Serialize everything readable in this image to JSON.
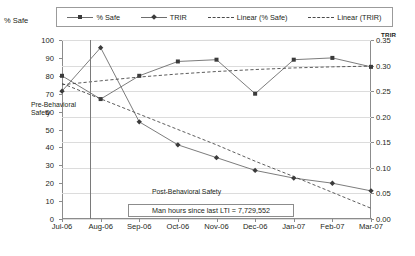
{
  "legend": {
    "items": [
      {
        "label": "% Safe",
        "marker": "square-marker",
        "line": "solid"
      },
      {
        "label": "TRIR",
        "marker": "diamond-marker",
        "line": "solid"
      },
      {
        "label": "Linear (% Safe)",
        "marker": "none",
        "line": "dashed"
      },
      {
        "label": "Linear (TRIR)",
        "marker": "none",
        "line": "dashed"
      }
    ]
  },
  "axes": {
    "left_title": "% Safe",
    "right_title": "TRIR",
    "left_ticks": [
      "100",
      "90",
      "80",
      "70",
      "60",
      "50",
      "40",
      "30",
      "20",
      "10",
      "0"
    ],
    "right_ticks": [
      "0.35",
      "0.30",
      "0.25",
      "0.20",
      "0.15",
      "0.10",
      "0.05",
      "0.00"
    ]
  },
  "annotations": {
    "pre": "Pre-Behavioral Safety",
    "post": "Post-Behavioral Safety",
    "man_hours": "Man hours since last LTI = 7,729,552"
  },
  "colors": {
    "series_line": "#6d6d6d",
    "marker": "#3b3b3b",
    "trend_line": "#4a4a4a",
    "grid": "#dcdcdc",
    "axis": "#8c8c8c"
  },
  "chart_data": {
    "type": "line",
    "title": "",
    "xlabel": "",
    "ylabel": "% Safe",
    "y2label": "TRIR",
    "categories": [
      "Jul-06",
      "Aug-06",
      "Sep-06",
      "Oct-06",
      "Nov-06",
      "Dec-06",
      "Jan-07",
      "Feb-07",
      "Mar-07"
    ],
    "ylim": [
      0,
      100
    ],
    "y2lim": [
      0.0,
      0.35
    ],
    "grid": true,
    "legend_position": "top",
    "series": [
      {
        "name": "% Safe",
        "axis": "left",
        "marker": "square",
        "style": "solid",
        "values": [
          80,
          67,
          80,
          88,
          89,
          70,
          89,
          90,
          85
        ]
      },
      {
        "name": "TRIR",
        "axis": "right",
        "marker": "diamond",
        "style": "solid",
        "values": [
          0.25,
          0.335,
          0.19,
          0.145,
          0.12,
          0.095,
          0.08,
          0.07,
          0.055
        ]
      },
      {
        "name": "Linear (% Safe)",
        "axis": "left",
        "marker": "none",
        "style": "dashed",
        "values": [
          75.0,
          77.2,
          79.3,
          81.0,
          82.4,
          83.5,
          84.4,
          85.0,
          85.4
        ]
      },
      {
        "name": "Linear (TRIR)",
        "axis": "right",
        "marker": "none",
        "style": "dashed",
        "values": [
          0.265,
          0.235,
          0.205,
          0.175,
          0.145,
          0.113,
          0.083,
          0.052,
          0.021
        ]
      }
    ]
  }
}
